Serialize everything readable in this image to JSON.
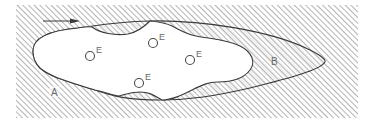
{
  "diagram": {
    "regions": {
      "outer": {
        "label": "A",
        "fill": "hatched"
      },
      "envelope": {
        "label": "B",
        "fill": "fine-hatched"
      },
      "core": {
        "label": "",
        "fill": "white"
      }
    },
    "markers": [
      {
        "symbol": "circle",
        "label": "E"
      },
      {
        "symbol": "circle",
        "label": "E"
      },
      {
        "symbol": "circle",
        "label": "E"
      },
      {
        "symbol": "circle",
        "label": "E"
      }
    ],
    "arrow": {
      "direction": "right"
    },
    "colors": {
      "line": "#3a3a3a",
      "hatch": "#8a8a8a",
      "fine_hatch": "#c4c4c4",
      "background": "#ffffff"
    }
  }
}
